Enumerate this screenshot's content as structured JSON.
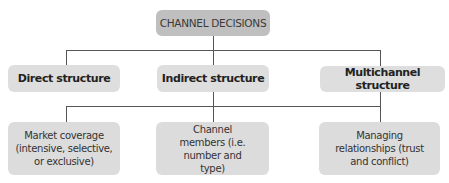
{
  "diagram": {
    "type": "hierarchy-tree",
    "colors": {
      "root_fill": "#bfbfbf",
      "node_fill": "#dedede",
      "connector": "#555555"
    },
    "root": {
      "label": "CHANNEL DECISIONS"
    },
    "structures": [
      {
        "label": "Direct structure"
      },
      {
        "label": "Indirect structure"
      },
      {
        "label": "Multichannel structure"
      }
    ],
    "decisions": [
      {
        "label": "Market coverage (intensive, selective, or exclusive)"
      },
      {
        "label": "Channel members (i.e. number and type)"
      },
      {
        "label": "Managing relationships (trust and conflict)"
      }
    ]
  }
}
